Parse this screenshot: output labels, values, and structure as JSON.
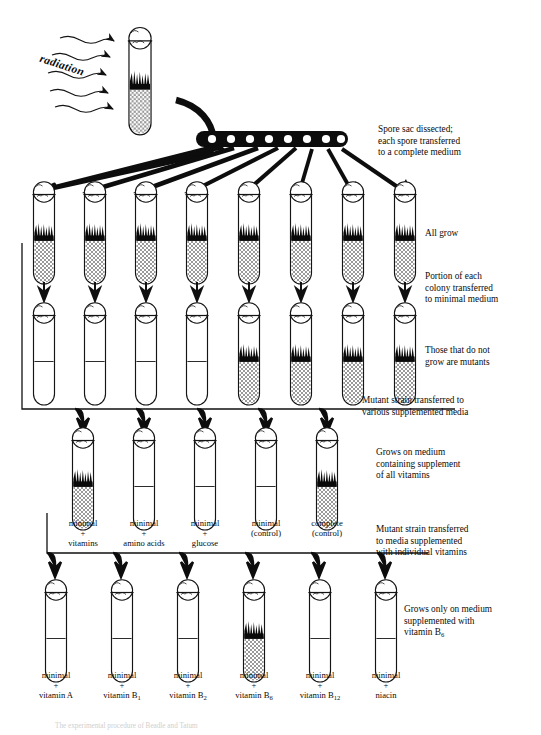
{
  "figure": {
    "radiation_label": "radiation",
    "bottom_caption": "The experimental procedure of Beadle and Tatum"
  },
  "captions": {
    "spore_sac": [
      "Spore sac dissected;",
      "each spore transferred",
      "to a complete medium"
    ],
    "all_grow": [
      "All grow"
    ],
    "portion_transferred": [
      "Portion of each",
      "colony transferred",
      "to minimal medium"
    ],
    "those_not_grow": [
      "Those that do not",
      "grow are mutants"
    ],
    "mutant_various": [
      "Mutant strain transferred to",
      "various supplemented media"
    ],
    "grows_all_vitamins": [
      "Grows on medium",
      "containing supplement",
      "of all vitamins"
    ],
    "mutant_individual": [
      "Mutant strain transferred",
      "to media supplemented",
      "with individual vitamins"
    ],
    "grows_b6": [
      "Grows only on medium",
      "supplemented with",
      "vitamin B",
      "6"
    ]
  },
  "rows": {
    "complete_medium_row": {
      "name": "All grow on complete medium",
      "count": 8,
      "growth": [
        true,
        true,
        true,
        true,
        true,
        true,
        true,
        true
      ]
    },
    "minimal_medium_row": {
      "name": "Transferred to minimal medium",
      "count": 8,
      "growth": [
        false,
        false,
        false,
        false,
        true,
        true,
        true,
        true
      ]
    },
    "supplement_row": {
      "name": "Various supplemented media",
      "count": 5,
      "growth": [
        true,
        false,
        false,
        false,
        true
      ],
      "labels": [
        {
          "l1": "minimal",
          "l2": "+",
          "l3": "vitamins"
        },
        {
          "l1": "minimal",
          "l2": "+",
          "l3": "amino acids"
        },
        {
          "l1": "minimal",
          "l2": "+",
          "l3": "glucose"
        },
        {
          "l1": "minimal",
          "l2": "(control)",
          "l3": ""
        },
        {
          "l1": "complete",
          "l2": "(control)",
          "l3": ""
        }
      ]
    },
    "individual_vitamin_row": {
      "name": "Individual vitamin media",
      "count": 6,
      "growth": [
        false,
        false,
        false,
        true,
        false,
        false
      ],
      "labels": [
        {
          "l1": "minimal",
          "l2": "+",
          "l3": "vitamin A",
          "sub": ""
        },
        {
          "l1": "minimal",
          "l2": "+",
          "l3": "vitamin B",
          "sub": "1"
        },
        {
          "l1": "minimal",
          "l2": "+",
          "l3": "vitamin B",
          "sub": "2"
        },
        {
          "l1": "minimal",
          "l2": "+",
          "l3": "vitamin B",
          "sub": "6"
        },
        {
          "l1": "minimal",
          "l2": "+",
          "l3": "vitamin B",
          "sub": "12"
        },
        {
          "l1": "minimal",
          "l2": "+",
          "l3": "niacin",
          "sub": ""
        }
      ]
    }
  },
  "elements": {
    "irradiated_tube": "irradiated-culture-tube",
    "spore_sac": "spore-sac-with-eight-spores",
    "spore_count": 8
  },
  "colors": {
    "ink": "#0b0b0b",
    "glass": "#1a1a1a",
    "medium_fill": "#b9b9b9",
    "growth": "#000000",
    "background": "#ffffff"
  }
}
